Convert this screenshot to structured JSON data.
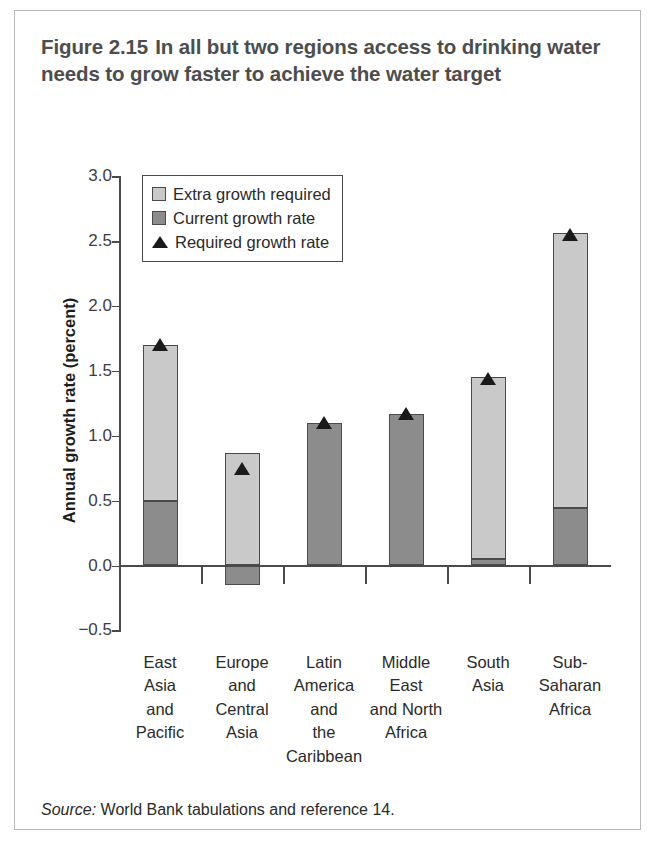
{
  "figure": {
    "number": "Figure 2.15",
    "title": "In all but two regions access to drinking water needs to grow faster to achieve the water target",
    "source_word": "Source:",
    "source_text": " World Bank tabulations and reference 14."
  },
  "legend": {
    "items": [
      {
        "label": "Extra growth required",
        "marker": "square-light",
        "color": "#c9c9c9"
      },
      {
        "label": "Current growth rate",
        "marker": "square-dark",
        "color": "#8c8c8c"
      },
      {
        "label": "Required growth rate",
        "marker": "triangle",
        "color": "#1a1a1a"
      }
    ]
  },
  "chart_data": {
    "type": "bar",
    "subtitle": "",
    "xlabel": "",
    "ylabel": "Annual growth rate (percent)",
    "ylim": [
      -0.5,
      3.0
    ],
    "yticks": [
      3.0,
      2.5,
      2.0,
      1.5,
      1.0,
      0.5,
      0.0,
      -0.5
    ],
    "ytick_labels": [
      "3.0",
      "2.5",
      "2.0",
      "1.5",
      "1.0",
      "0.5",
      "0.0",
      "−0.5"
    ],
    "grid": false,
    "legend_position": "upper-left-inside",
    "stacked": true,
    "categories": [
      "East Asia and Pacific",
      "Europe and Central Asia",
      "Latin America and the Caribbean",
      "Middle East and North Africa",
      "South Asia",
      "Sub-Saharan Africa"
    ],
    "category_label_lines": [
      [
        "East",
        "Asia",
        "and",
        "Pacific"
      ],
      [
        "Europe",
        "and",
        "Central",
        "Asia"
      ],
      [
        "Latin",
        "America",
        "and",
        "the",
        "Caribbean"
      ],
      [
        "Middle",
        "East",
        "and North",
        "Africa"
      ],
      [
        "South",
        "Asia"
      ],
      [
        "Sub-",
        "Saharan",
        "Africa"
      ]
    ],
    "series": [
      {
        "name": "Current growth rate",
        "color": "#8c8c8c",
        "values": [
          0.5,
          -0.15,
          1.1,
          1.17,
          0.05,
          0.44
        ]
      },
      {
        "name": "Extra growth required",
        "color": "#c9c9c9",
        "values": [
          1.2,
          0.87,
          0.0,
          0.0,
          1.4,
          2.12
        ]
      }
    ],
    "markers": {
      "name": "Required growth rate",
      "color": "#1a1a1a",
      "values": [
        1.7,
        0.75,
        1.1,
        1.17,
        1.44,
        2.55
      ]
    },
    "bar_tops": [
      1.7,
      0.87,
      1.1,
      1.17,
      1.45,
      2.56
    ]
  }
}
